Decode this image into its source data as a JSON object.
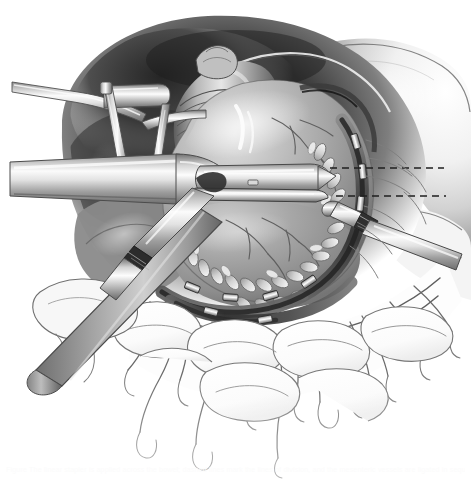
{
  "figure": {
    "medium": "grayscale airbrush medical illustration",
    "background_color": "#ffffff",
    "width": 471,
    "height": 480,
    "caption": "Figure   The linear stapler is applied across the bowel; dashed lines mark the lines of division, and the mesenteric vessels are ligated in sequence.",
    "palette": {
      "paper": "#ffffff",
      "deep_shadow": "#2b2b2b",
      "mid_shadow": "#6e6e6e",
      "tissue_mid": "#9a9a9a",
      "tissue_light": "#c9c9c9",
      "tissue_highlight": "#ececec",
      "metal_dark": "#777777",
      "metal_mid": "#b4b4b4",
      "metal_highlight": "#f3f3f3",
      "line_ink": "#5a5a5a",
      "line_ink_soft": "#8d8d8d",
      "vessel_ink": "#6a6a6a",
      "dashed_guide": "#1f1f1f"
    },
    "regions": [
      {
        "name": "upper-shadow-cavity",
        "label": "deep peritoneal cavity shadow",
        "tone": "#2f2f2f"
      },
      {
        "name": "central-bowel-mass",
        "label": "mobilized cecum / ascending colon",
        "tone": "#a2a2a2"
      },
      {
        "name": "mesentery-fan",
        "label": "mesentery with vascular arcades",
        "tone": "#fdfdfd"
      },
      {
        "name": "small-bowel-loops",
        "label": "adjacent small bowel loops",
        "tone": "#fcfcfc"
      },
      {
        "name": "right-abdominal-wall",
        "label": "retracted abdominal wall",
        "tone": "#e3e3e3"
      }
    ],
    "instruments": [
      {
        "name": "retractor-blade-upper-left",
        "label": "angled malleable retractor blade",
        "orientation": "horizontal-left"
      },
      {
        "name": "retractor-frame-bar",
        "label": "self-retaining retractor frame bar",
        "orientation": "bent-vertical"
      },
      {
        "name": "stapler-shaft",
        "label": "linear stapler shaft",
        "orientation": "horizontal"
      },
      {
        "name": "stapler-cartridge-jaw",
        "label": "stapler cartridge jaw",
        "orientation": "horizontal-right"
      },
      {
        "name": "stapler-anvil-jaw",
        "label": "stapler anvil jaw",
        "orientation": "horizontal-right"
      },
      {
        "name": "clamp-forceps-right",
        "label": "right-angle clamp on mesenteric vessel",
        "orientation": "diagonal-right"
      },
      {
        "name": "clamp-forceps-left",
        "label": "hemostat on mesenteric pedicle",
        "orientation": "diagonal-left"
      },
      {
        "name": "ribbon-retractor-diagonal",
        "label": "flat ribbon retractor across the field",
        "orientation": "diagonal"
      }
    ],
    "annotations": [
      {
        "name": "dashed-division-line-upper",
        "label": "proposed line of bowel division (upper)",
        "style": "dashed"
      },
      {
        "name": "dashed-division-line-lower",
        "label": "proposed line of bowel division (lower)",
        "style": "dashed"
      }
    ],
    "tissue_features": [
      {
        "name": "appendices-epiploicae",
        "label": "appendices epiploicae along the taenia",
        "count": 22
      },
      {
        "name": "ligature-clips",
        "label": "vessel ligature clips on mesenteric border",
        "count": 9
      },
      {
        "name": "vascular-arcade",
        "label": "ileocolic vascular arcade",
        "count": 14
      },
      {
        "name": "serosal-vessels",
        "label": "branching serosal vessels on the bowel surface",
        "count": 11
      },
      {
        "name": "cut-mesenteric-edge",
        "label": "divided mesenteric edge with dark hematoma",
        "count": 1
      }
    ]
  }
}
